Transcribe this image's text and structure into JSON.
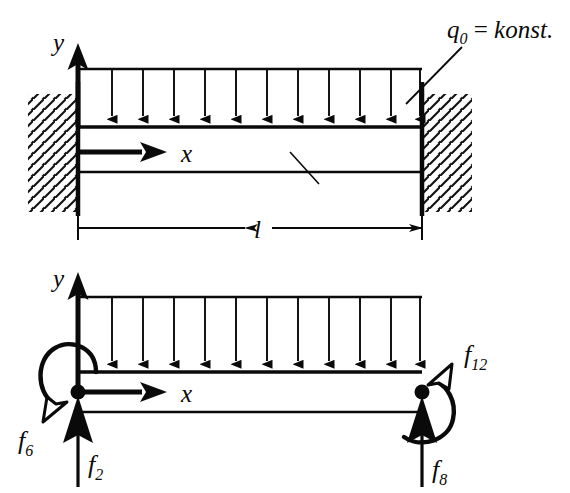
{
  "figure": {
    "colors": {
      "ink": "#0a0a0a",
      "background": "#ffffff",
      "hatch": "#111111"
    },
    "panels": [
      {
        "id": "top",
        "name": "continuous-beam-with-distributed-load",
        "labels": {
          "load": "q",
          "load_subscript": "0",
          "load_equals": " = ",
          "load_value": "konst.",
          "load_full": "q0 = konst.",
          "y_axis": "y",
          "x_axis": "x",
          "length": "l"
        },
        "geometry": {
          "beam_left_x": 78,
          "beam_right_x": 422,
          "beam_top_y": 127,
          "beam_bottom_y": 172,
          "load_top_y": 69,
          "arrow_count": 11,
          "dim_line_y": 227
        }
      },
      {
        "id": "bottom",
        "name": "beam-element-with-nodal-forces",
        "labels": {
          "y_axis": "y",
          "x_axis": "x",
          "force_left_vertical": "f",
          "force_left_vertical_sub": "2",
          "force_left_moment": "f",
          "force_left_moment_sub": "6",
          "force_right_vertical": "f",
          "force_right_vertical_sub": "8",
          "force_right_moment": "f",
          "force_right_moment_sub": "12"
        },
        "geometry": {
          "beam_left_x": 78,
          "beam_right_x": 422,
          "beam_top_y": 372,
          "beam_bottom_y": 412,
          "load_top_y": 297,
          "arrow_count": 11,
          "node_left_x": 78,
          "node_right_x": 422,
          "node_y": 392
        }
      }
    ]
  }
}
